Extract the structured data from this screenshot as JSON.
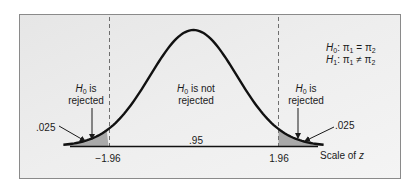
{
  "chart_data": {
    "type": "area",
    "distribution": "standard normal",
    "xlabel": "Scale of z",
    "critical_values": [
      -1.96,
      1.96
    ],
    "regions": [
      {
        "name": "left-rejection",
        "range": [
          -3.5,
          -1.96
        ],
        "area": 0.025,
        "label": "H0 is rejected",
        "shaded": true
      },
      {
        "name": "acceptance",
        "range": [
          -1.96,
          1.96
        ],
        "area": 0.95,
        "label": "H0 is not rejected",
        "shaded": false
      },
      {
        "name": "right-rejection",
        "range": [
          1.96,
          3.5
        ],
        "area": 0.025,
        "label": "H0 is rejected",
        "shaded": true
      }
    ],
    "hypotheses": [
      "H0: π1 = π2",
      "H1: π1 ≠ π2"
    ]
  },
  "labels": {
    "left_region": {
      "h": "H",
      "sub": "0",
      "line1_rest": " is",
      "line2": "rejected"
    },
    "center_region": {
      "h": "H",
      "sub": "0",
      "line1_rest": " is not",
      "line2": "rejected"
    },
    "right_region": {
      "h": "H",
      "sub": "0",
      "line1_rest": " is",
      "line2": "rejected"
    },
    "left_area": ".025",
    "right_area": ".025",
    "center_area": ".95",
    "left_critical": "−1.96",
    "right_critical": "1.96",
    "axis_label_prefix": "Scale of ",
    "axis_label_var": "z"
  },
  "hypotheses": {
    "null": {
      "h": "H",
      "sub": "0",
      "rest": ": π",
      "s1": "1",
      "op": " = π",
      "s2": "2"
    },
    "alt": {
      "h": "H",
      "sub": "1",
      "rest": ": π",
      "s1": "1",
      "op": " ≠ π",
      "s2": "2"
    }
  },
  "colors": {
    "background": "#ececec",
    "frame": "#8a8a8a",
    "curve": "#111111",
    "tail_fill": "#a9a9a9",
    "dashed": "#6e6e6e"
  }
}
